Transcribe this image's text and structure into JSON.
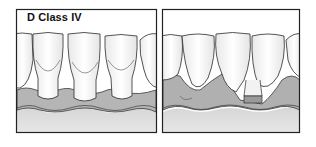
{
  "figure": {
    "title": "D Class IV",
    "panels": [
      {
        "id": "left",
        "description": "Teeth with intact gingiva and interdental papillae filling embrasures"
      },
      {
        "id": "right",
        "description": "Teeth with gingival recession and loss of interdental papillae"
      }
    ],
    "colors": {
      "outline": "#2b2b2b",
      "tooth": "#fafafa",
      "tooth_shade": "#e6e6e6",
      "gum": "#b3b3b3",
      "gum_light": "#d2d2d2",
      "bone": "#dcdcdc",
      "background": "#ffffff"
    }
  }
}
